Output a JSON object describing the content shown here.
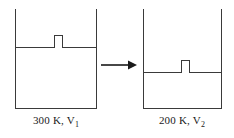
{
  "diagram": {
    "type": "gas-compression-piston-diagram",
    "orientation": "left-to-right",
    "transition_icon": "right-arrow-icon",
    "vessels": [
      {
        "id": "left",
        "role": "initial-state",
        "piston_icon": "piston-knob-icon",
        "caption": "300 K, V",
        "caption_subscript": "1",
        "temperature": "300 K",
        "volume_symbol": "V",
        "volume_subscript": "1",
        "fill_level_label": "high",
        "geometry": {
          "left_wall_x": 15,
          "right_wall_x": 97,
          "top_y": 9,
          "bottom_y": 108,
          "level_y": 47,
          "piston_x": 54,
          "piston_width": 9,
          "piston_top_y": 35
        }
      },
      {
        "id": "right",
        "role": "final-state",
        "piston_icon": "piston-knob-icon",
        "caption": "200 K, V",
        "caption_subscript": "2",
        "temperature": "200 K",
        "volume_symbol": "V",
        "volume_subscript": "2",
        "fill_level_label": "low",
        "geometry": {
          "left_wall_x": 143,
          "right_wall_x": 222,
          "top_y": 9,
          "bottom_y": 108,
          "level_y": 72,
          "piston_x": 181,
          "piston_width": 9,
          "piston_top_y": 60
        }
      }
    ],
    "colors": {
      "line": "#3a3a3a",
      "text": "#1a1a1a",
      "background": "#ffffff",
      "arrow": "#1a1a1a"
    }
  }
}
